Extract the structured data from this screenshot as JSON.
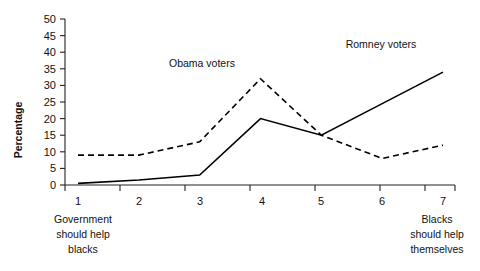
{
  "chart_data": {
    "type": "line",
    "title": "",
    "xlabel": "",
    "ylabel": "Percentage",
    "categories": [
      "1",
      "2",
      "3",
      "4",
      "5",
      "6",
      "7"
    ],
    "x": [
      1,
      2,
      3,
      4,
      5,
      6,
      7
    ],
    "xlim": [
      1,
      7
    ],
    "ylim": [
      0,
      50
    ],
    "ytick_labels": [
      "0",
      "5",
      "10",
      "15",
      "20",
      "25",
      "30",
      "35",
      "40",
      "45",
      "50"
    ],
    "ytick_values": [
      0,
      5,
      10,
      15,
      20,
      25,
      30,
      35,
      40,
      45,
      50
    ],
    "grid": false,
    "legend_position": "inline-annotations",
    "series": [
      {
        "name": "Obama voters",
        "style": "dashed",
        "color": "#000000",
        "values": [
          9,
          9,
          13,
          32,
          15,
          8,
          12
        ]
      },
      {
        "name": "Romney voters",
        "style": "solid",
        "color": "#000000",
        "values": [
          0.5,
          1.5,
          3,
          20,
          15,
          24.5,
          34
        ]
      }
    ],
    "annotations": [
      {
        "text": "Obama voters",
        "x": 3.0,
        "y": 30
      },
      {
        "text": "Romney voters",
        "x": 5.6,
        "y": 37
      }
    ],
    "axis_end_captions": {
      "left": [
        "Government",
        "should help",
        "blacks"
      ],
      "right": [
        "Blacks",
        "should help",
        "themselves"
      ]
    }
  }
}
